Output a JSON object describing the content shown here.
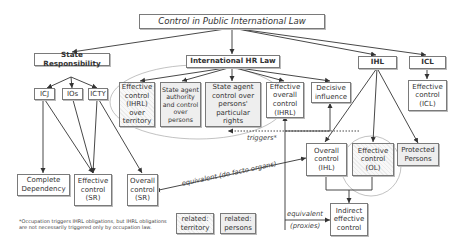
{
  "title": "Control in Public International Law",
  "branches": {
    "state_responsibility": "State Responsibility",
    "ihr_law": "International HR Law",
    "ihl": "IHL",
    "icl": "ICL"
  },
  "courts": {
    "icj": "ICJ",
    "ios": "IOs",
    "icty": "ICTY"
  },
  "ihrl_nodes": {
    "effective_control_territory": [
      "Effective",
      "control",
      "(IHRL)",
      "over",
      "territory"
    ],
    "state_agent_authority": [
      "State agent",
      "authority",
      "and control",
      "over",
      "persons"
    ],
    "state_agent_rights": [
      "State agent",
      "control over",
      "persons'",
      "particular",
      "rights"
    ],
    "effective_overall_control": [
      "Effective",
      "overall",
      "control",
      "(IHRL)"
    ],
    "decisive_influence": [
      "Decisive",
      "influence"
    ]
  },
  "icl_nodes": {
    "effective_control_icl": [
      "Effective",
      "control",
      "(ICL)"
    ]
  },
  "ihl_nodes": {
    "overall_control_ihl": [
      "Overall",
      "control",
      "(IHL)"
    ],
    "effective_control_ol": [
      "Effective",
      "control",
      "(OL)"
    ],
    "protected_persons": [
      "Protected",
      "Persons"
    ],
    "indirect_effective_control": [
      "Indirect",
      "effective",
      "control"
    ]
  },
  "sr_nodes": {
    "complete_dependency": [
      "Complete",
      "Dependency"
    ],
    "effective_control_sr": [
      "Effective",
      "control",
      "(SR)"
    ],
    "overall_control_sr": [
      "Overall",
      "control",
      "(SR)"
    ]
  },
  "edge_labels": {
    "triggers": "triggers*",
    "equivalent_de_facto": "equivalent (de facto organs)",
    "equivalent": "equivalent",
    "proxies": "(proxies)"
  },
  "legend": {
    "territory": [
      "related:",
      "territory"
    ],
    "persons": [
      "related:",
      "persons"
    ]
  },
  "footnote": [
    "*Occupation triggers IHRL obligations, but IHRL obligations",
    "are not necessarily triggered only by occupation law."
  ]
}
